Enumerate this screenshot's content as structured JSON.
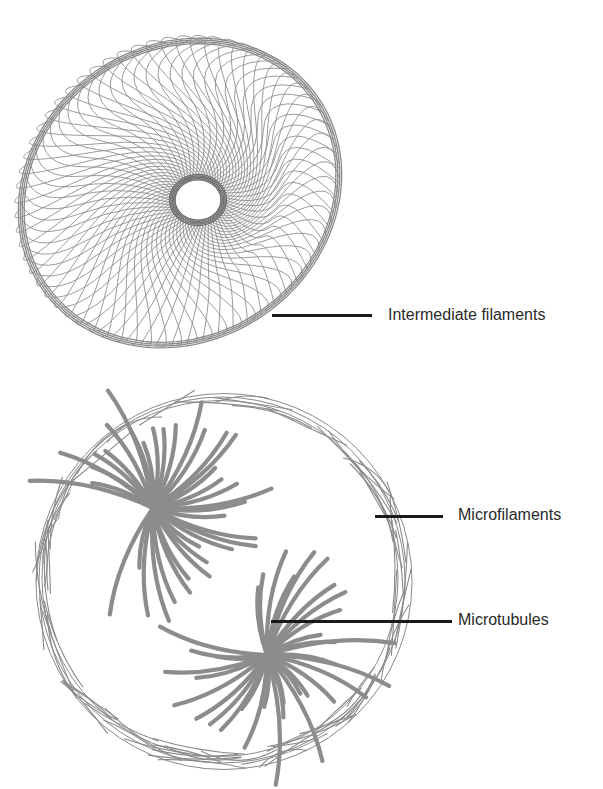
{
  "figure": {
    "type": "cytoskeleton-diagram",
    "colors": {
      "background": "#ffffff",
      "filament": "#8a8a8a",
      "leader": "#1a1a1a",
      "text": "#2a2a2a"
    }
  },
  "labels": {
    "intermediate_filaments": "Intermediate filaments",
    "microfilaments": "Microfilaments",
    "microtubules": "Microtubules"
  },
  "cells": [
    {
      "id": "top-cell",
      "structure": "intermediate filament network radiating from nucleus",
      "labels": [
        "intermediate_filaments"
      ]
    },
    {
      "id": "bottom-cell",
      "structure": "cortical microfilaments with two microtubule asters",
      "labels": [
        "microfilaments",
        "microtubules"
      ]
    }
  ]
}
